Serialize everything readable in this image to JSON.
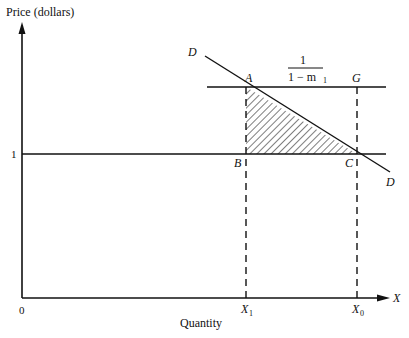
{
  "diagram": {
    "y_axis_label": "Price (dollars)",
    "x_axis_label": "Quantity",
    "x_axis_end_label": "X",
    "origin_label": "0",
    "price_level_label": "1",
    "demand_label_top": "D",
    "demand_label_bottom": "D",
    "points": {
      "A": "A",
      "B": "B",
      "C": "C",
      "G": "G"
    },
    "x_ticks": {
      "x1_main": "X",
      "x1_sub": "1",
      "x0_main": "X",
      "x0_sub": "0"
    },
    "price_line_label": {
      "numerator": "1",
      "denominator_prefix": "1 − m",
      "denominator_sub": "1"
    },
    "shaded_region": "triangle ABC (hatched)",
    "colors": {
      "ink": "#111111",
      "background": "#ffffff"
    }
  }
}
